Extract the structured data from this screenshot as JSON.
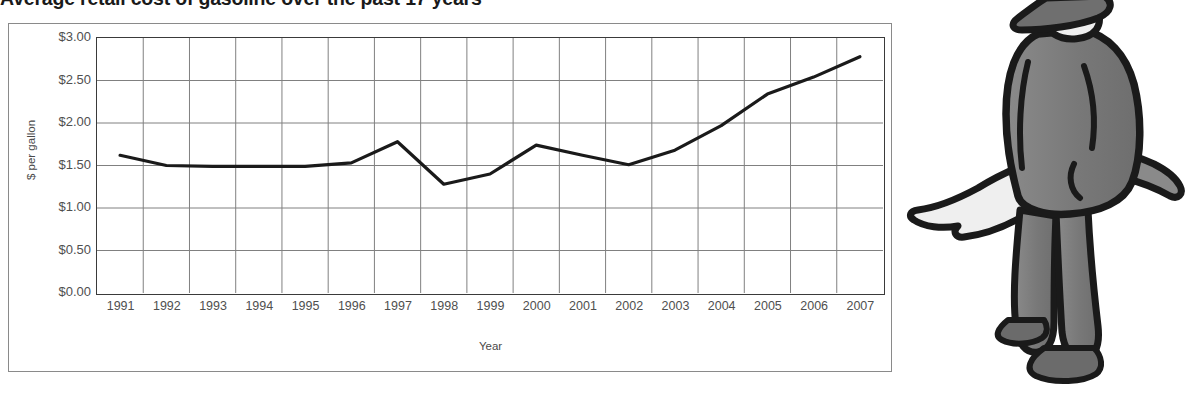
{
  "chart_data": {
    "type": "line",
    "title": "Average retail cost of gasoline over the past 17 years",
    "xlabel": "Year",
    "ylabel": "$ per gallon",
    "ylim": [
      0.0,
      3.0
    ],
    "ytick_step": 0.5,
    "grid": true,
    "legend": "none",
    "minor_ticks_y": true,
    "categories": [
      "1991",
      "1992",
      "1993",
      "1994",
      "1995",
      "1996",
      "1997",
      "1998",
      "1999",
      "2000",
      "2001",
      "2002",
      "2003",
      "2004",
      "2005",
      "2006",
      "2007"
    ],
    "values": [
      1.62,
      1.5,
      1.49,
      1.49,
      1.49,
      1.53,
      1.78,
      1.28,
      1.4,
      1.74,
      1.62,
      1.51,
      1.68,
      1.97,
      2.34,
      2.54,
      2.78
    ],
    "ytick_labels": [
      "$3.00",
      "$2.50",
      "$2.00",
      "$1.50",
      "$1.00",
      "$0.50",
      "$0.00"
    ],
    "ytick_values": [
      3.0,
      2.5,
      2.0,
      1.5,
      1.0,
      0.5,
      0.0
    ],
    "line_color": "#1a1a1a",
    "grid_color": "#808080",
    "axis_color": "#3a3a3a"
  },
  "illustration": {
    "name": "cartoon-man-pointing-left",
    "description": "Cartoon man in gray suit and hat pointing left toward the chart",
    "suit_color": "#7d7d7d",
    "outline_color": "#1a1a1a",
    "skin_color": "#e8e8e8",
    "hat_color": "#6f6f6f",
    "shoe_color": "#6b6b6b"
  }
}
